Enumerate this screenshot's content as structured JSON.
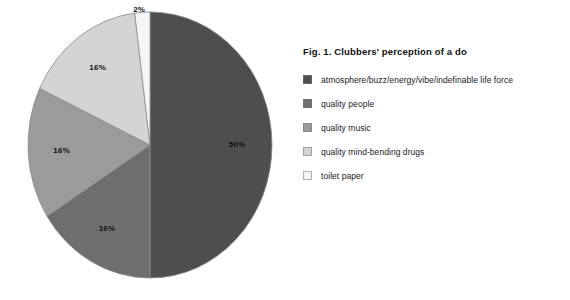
{
  "chart_data": {
    "type": "pie",
    "title": "Fig. 1. Clubbers' perception of a do",
    "xlabel": "",
    "ylabel": "",
    "legend_position": "right",
    "grid": false,
    "categories": [
      "atmosphere/buzz/energy/vibe/indefinable life force",
      "quality people",
      "quality music",
      "quality mind-bending drugs",
      "toilet paper"
    ],
    "values": [
      50,
      16,
      16,
      16,
      2
    ],
    "value_labels": [
      "50%",
      "16%",
      "16%",
      "16%",
      "2%"
    ],
    "colors": [
      "#4e4e4e",
      "#6e6e6e",
      "#9b9b9b",
      "#d4d4d4",
      "#f5f5f5"
    ],
    "slices": [
      {
        "label": "atmosphere/buzz/energy/vibe/indefinable life force",
        "value": 50,
        "value_label": "50%",
        "color": "#4e4e4e"
      },
      {
        "label": "quality people",
        "value": 16,
        "value_label": "16%",
        "color": "#6e6e6e"
      },
      {
        "label": "quality music",
        "value": 16,
        "value_label": "16%",
        "color": "#9b9b9b"
      },
      {
        "label": "quality mind-bending drugs",
        "value": 16,
        "value_label": "16%",
        "color": "#d4d4d4"
      },
      {
        "label": "toilet paper",
        "value": 2,
        "value_label": "2%",
        "color": "#f5f5f5"
      }
    ]
  },
  "legend": {
    "items": [
      {
        "label": "atmosphere/buzz/energy/vibe/indefinable life force",
        "color": "#4e4e4e"
      },
      {
        "label": "quality people",
        "color": "#6e6e6e"
      },
      {
        "label": "quality music",
        "color": "#9b9b9b"
      },
      {
        "label": "quality mind-bending drugs",
        "color": "#d4d4d4"
      },
      {
        "label": "toilet paper",
        "color": "#f5f5f5"
      }
    ]
  }
}
